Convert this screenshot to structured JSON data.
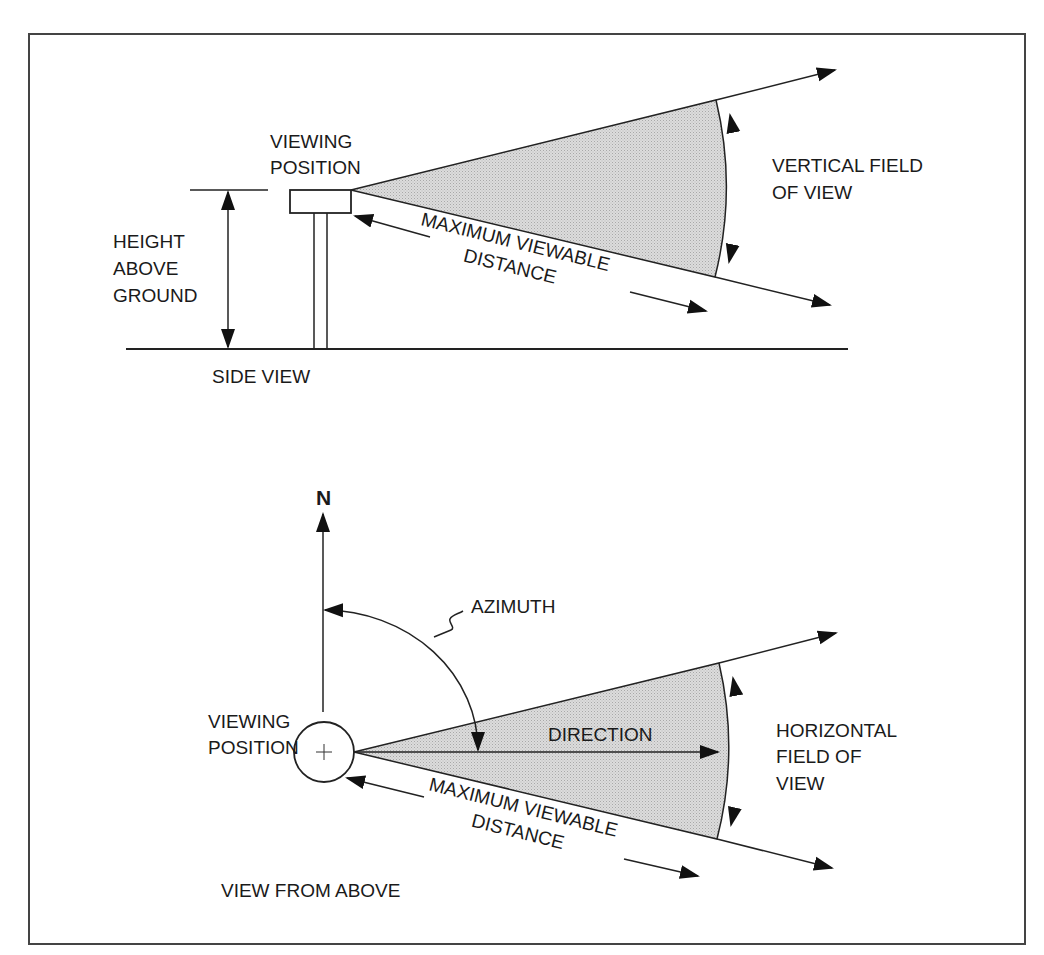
{
  "colors": {
    "line": "#222222",
    "fill": "#d8d8d8",
    "text": "#1a1a1a",
    "background": "#ffffff"
  },
  "side_view": {
    "caption": "SIDE VIEW",
    "viewing_position": {
      "line1": "VIEWING",
      "line2": "POSITION"
    },
    "height_above_ground": {
      "line1": "HEIGHT",
      "line2": "ABOVE",
      "line3": "GROUND"
    },
    "vertical_fov": {
      "line1": "VERTICAL FIELD",
      "line2": "OF VIEW"
    },
    "max_distance": {
      "line1": "MAXIMUM VIEWABLE",
      "line2": "DISTANCE"
    }
  },
  "top_view": {
    "caption": "VIEW FROM ABOVE",
    "north": "N",
    "azimuth": "AZIMUTH",
    "direction": "DIRECTION",
    "viewing_position": {
      "line1": "VIEWING",
      "line2": "POSITION"
    },
    "horizontal_fov": {
      "line1": "HORIZONTAL",
      "line2": "FIELD OF",
      "line3": "VIEW"
    },
    "max_distance": {
      "line1": "MAXIMUM VIEWABLE",
      "line2": "DISTANCE"
    }
  }
}
